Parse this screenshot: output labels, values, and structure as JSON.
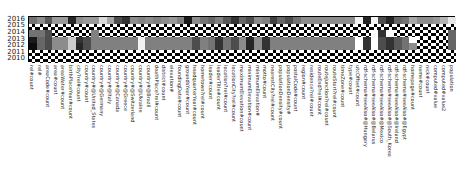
{
  "chart_data": {
    "type": "heatmap",
    "title": "",
    "xlabel": "",
    "ylabel": "",
    "y_categories": [
      "2016",
      "2015",
      "2014",
      "2013",
      "2012",
      "2011",
      "2010"
    ],
    "x_categories": [
      "rel#count",
      "rel#",
      "areaCode#count",
      "area#count",
      "areaWater#count",
      "birthPlaceYear#count",
      "city?rel#count",
      "country#count",
      "country#@United_States",
      "country#@Germany",
      "country#@Italy",
      "country#@Canada",
      "country#@Greece",
      "country#@Switzerland",
      "country#@Ukraine",
      "country#@Brazil",
      "deathPlace?rel#count",
      "district#count",
      "elevation#",
      "foundingDate#count",
      "groundsYear#count",
      "headquarterYear#count",
      "hometown?rel#count",
      "leader#count",
      "leaderTitle#count",
      "location?rel#count",
      "locationCity?rel#count",
      "maximumElevation#count",
      "minimumElevation#count",
      "minimumElevation#",
      "motto#count",
      "nearestCity?rel#count",
      "populationDensity#count",
      "populationDensity#",
      "postalCode#count",
      "region#count",
      "residence?rel#count",
      "routeEnd?rel#count",
      "routeJunction?rel#count",
      "routeStart?rel#count",
      "timeZone#count",
      "type#count",
      "utcOffset#count",
      "rdf-schema#seeAlso#@Hungary",
      "rdf-schema#seeAlso#@Belarus",
      "rdf-schema#seeAlso#@Mexico",
      "rdf-schema#seeAlso#@South_Korea",
      "rdf-schema#seeAlso#@Ireland",
      "rdf-schema#seeAlso#@Egypt",
      "homepage#count",
      "name#count",
      "nick#count",
      "computed#value",
      "computed#value2",
      "population"
    ],
    "colormap": "grayscale",
    "missing_pattern": "checkerboard",
    "missing_rows": [
      "2015",
      "2011",
      "2010"
    ],
    "values": {
      "2016": [
        0.45,
        0.55,
        0.35,
        0.6,
        0.6,
        0.15,
        0.55,
        0.6,
        0.6,
        0.85,
        0.65,
        0.3,
        0.2,
        0.55,
        0.5,
        0.55,
        0.5,
        0.55,
        0.6,
        0.5,
        0.1,
        0.55,
        0.45,
        0.4,
        0.5,
        0.35,
        0.2,
        0.4,
        0.3,
        0.55,
        0.5,
        0.25,
        0.4,
        0.3,
        0.45,
        0.55,
        0.55,
        0.55,
        0.55,
        0.55,
        0.55,
        0.55,
        0.95,
        0.15,
        0.95,
        0.3,
        0.15,
        0.4,
        0.45,
        0.65,
        0.55,
        0.55,
        0.6,
        0.7,
        0.9
      ],
      "2014": [
        0.45,
        0.45,
        0.3,
        null,
        null,
        null,
        null,
        null,
        0.5,
        null,
        null,
        null,
        null,
        null,
        null,
        null,
        null,
        null,
        null,
        null,
        null,
        null,
        null,
        null,
        null,
        null,
        null,
        null,
        null,
        null,
        null,
        null,
        null,
        null,
        null,
        null,
        null,
        null,
        null,
        null,
        null,
        null,
        null,
        null,
        1.0,
        0.2,
        1.0,
        null,
        null,
        null,
        null,
        null,
        null,
        null,
        0.4
      ],
      "2013": [
        0.1,
        0.4,
        0.3,
        0.55,
        0.55,
        0.8,
        0.2,
        0.3,
        0.5,
        0.5,
        0.5,
        0.5,
        0.5,
        0.5,
        0.95,
        0.5,
        0.5,
        0.5,
        0.5,
        0.5,
        0.5,
        0.3,
        0.5,
        0.45,
        0.2,
        0.45,
        0.3,
        0.55,
        0.15,
        0.55,
        0.2,
        0.5,
        0.5,
        0.5,
        0.5,
        0.5,
        0.5,
        0.5,
        0.5,
        0.5,
        0.5,
        0.5,
        1.0,
        0.2,
        1.0,
        0.3,
        0.2,
        0.35,
        0.45,
        1.0,
        null,
        null,
        null,
        null,
        0.4
      ],
      "2012": [
        0.05,
        0.4,
        0.3,
        0.55,
        0.55,
        0.8,
        0.15,
        0.3,
        0.5,
        0.5,
        0.5,
        0.5,
        0.5,
        0.5,
        0.95,
        0.5,
        0.5,
        0.5,
        0.5,
        0.5,
        0.5,
        0.3,
        0.5,
        0.45,
        0.2,
        0.45,
        0.3,
        0.55,
        0.15,
        0.55,
        0.2,
        0.5,
        0.5,
        0.5,
        0.5,
        0.5,
        0.5,
        0.5,
        0.5,
        0.5,
        0.5,
        0.5,
        1.0,
        0.2,
        1.0,
        0.3,
        0.2,
        0.35,
        0.45,
        0.55,
        null,
        null,
        null,
        null,
        0.4
      ]
    },
    "legend": null,
    "grid": false
  }
}
